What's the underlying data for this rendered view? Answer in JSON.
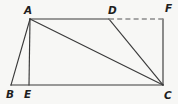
{
  "figure": {
    "background_color": "#f7f7f5",
    "line_color": "#3a3a3a",
    "dashed_line_color": "#8a8a8a",
    "label_color": "#1e1e1e",
    "width": 178,
    "height": 104,
    "vertices": [
      {
        "id": "A",
        "label": "A",
        "x": 30,
        "y": 19,
        "label_x": 24,
        "label_y": 5
      },
      {
        "id": "D",
        "label": "D",
        "x": 109,
        "y": 19,
        "label_x": 108,
        "label_y": 5
      },
      {
        "id": "F",
        "label": "F",
        "x": 163,
        "y": 19,
        "label_x": 165,
        "label_y": 3
      },
      {
        "id": "B",
        "label": "B",
        "x": 11,
        "y": 85,
        "label_x": 6,
        "label_y": 89
      },
      {
        "id": "E",
        "label": "E",
        "x": 29,
        "y": 85,
        "label_x": 24,
        "label_y": 89
      },
      {
        "id": "C",
        "label": "C",
        "x": 163,
        "y": 85,
        "label_x": 164,
        "label_y": 90
      }
    ],
    "edges": [
      {
        "id": "AB",
        "from": "A",
        "to": "B",
        "style": "solid",
        "x1": 30,
        "y1": 19,
        "x2": 11,
        "y2": 85
      },
      {
        "id": "AE",
        "from": "A",
        "to": "E",
        "style": "solid",
        "x1": 30,
        "y1": 19,
        "x2": 29,
        "y2": 85
      },
      {
        "id": "AD",
        "from": "A",
        "to": "D",
        "style": "solid",
        "x1": 30,
        "y1": 19,
        "x2": 109,
        "y2": 19
      },
      {
        "id": "AC",
        "from": "A",
        "to": "C",
        "style": "solid",
        "x1": 30,
        "y1": 19,
        "x2": 163,
        "y2": 85
      },
      {
        "id": "DC",
        "from": "D",
        "to": "C",
        "style": "solid",
        "x1": 109,
        "y1": 19,
        "x2": 163,
        "y2": 85
      },
      {
        "id": "BC",
        "from": "B",
        "to": "C",
        "style": "solid",
        "x1": 11,
        "y1": 85,
        "x2": 163,
        "y2": 85
      },
      {
        "id": "FC",
        "from": "F",
        "to": "C",
        "style": "solid",
        "x1": 163,
        "y1": 19,
        "x2": 163,
        "y2": 85
      },
      {
        "id": "DF",
        "from": "D",
        "to": "F",
        "style": "dashed",
        "x1": 109,
        "y1": 19,
        "x2": 163,
        "y2": 19
      }
    ]
  }
}
